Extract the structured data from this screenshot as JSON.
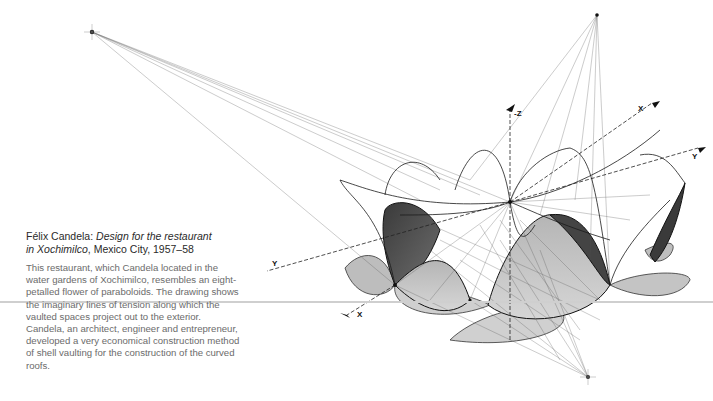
{
  "caption": {
    "author": "Félix Candela: ",
    "title_italic_1": "Design for the restaurant",
    "title_italic_2": "in Xochimilco",
    "location_date": ", Mexico City, 1957–58",
    "body": "This restaurant, which Candela located in the water gardens of Xochimilco, resembles an eight-petalled flower of paraboloids. The drawing shows the imaginary lines of tension along which the vaulted spaces project out to the exterior. Candela, an architect, engineer and entrepreneur, developed a very economical construction method of shell vaulting for the construction of the curved roofs."
  },
  "drawing": {
    "axis_labels": {
      "neg_z": "-Z",
      "x_upper": "X",
      "y_right": "Y",
      "y_left": "Y",
      "x_lower": "X"
    },
    "colors": {
      "ink": "#1a1a1a",
      "shade_dark": "#4a4a4a",
      "shade_mid": "#9a9a9a",
      "shade_light": "#c8c8c8",
      "rule": "#cfcfcf"
    }
  }
}
